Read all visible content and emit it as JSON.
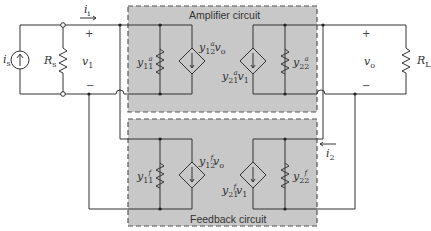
{
  "diagram": {
    "type": "feedback amplifier y-parameter equivalent circuit",
    "blocks": {
      "amplifier": {
        "title": "Amplifier circuit",
        "fill": "#c8c8c8",
        "border": "#555555"
      },
      "feedback": {
        "title": "Feedback circuit",
        "fill": "#c8c8c8",
        "border": "#555555"
      }
    },
    "source": {
      "current": "i",
      "current_sub": "s",
      "resistor": "R",
      "resistor_sub": "s"
    },
    "input": {
      "voltage": "v",
      "voltage_sub": "1",
      "current": "i",
      "current_sub": "i",
      "plus": "+",
      "minus": "−"
    },
    "output": {
      "voltage": "v",
      "voltage_sub": "o",
      "load": "R",
      "load_sub": "L",
      "plus": "+",
      "minus": "−",
      "current": "i",
      "current_sub": "2"
    },
    "amp_elements": {
      "y11": {
        "base": "y",
        "sup": "a",
        "sub": "11"
      },
      "y12": {
        "base": "y",
        "sup": "a",
        "sub": "12",
        "ctrl": "v",
        "ctrl_sub": "o"
      },
      "y21": {
        "base": "y",
        "sup": "a",
        "sub": "21",
        "ctrl": "v",
        "ctrl_sub": "1"
      },
      "y22": {
        "base": "y",
        "sup": "a",
        "sub": "22"
      }
    },
    "fb_elements": {
      "y11": {
        "base": "y",
        "sup": "f",
        "sub": "11"
      },
      "y12": {
        "base": "y",
        "sup": "f",
        "sub": "12",
        "ctrl": "v",
        "ctrl_sub": "o"
      },
      "y21": {
        "base": "y",
        "sup": "f",
        "sub": "21",
        "ctrl": "v",
        "ctrl_sub": "1"
      },
      "y22": {
        "base": "y",
        "sup": "f",
        "sub": "22"
      }
    }
  }
}
